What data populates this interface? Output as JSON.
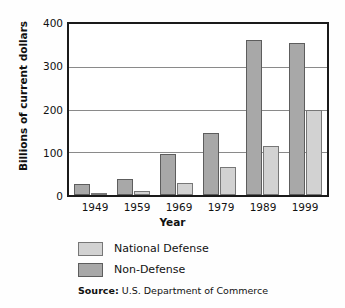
{
  "chart_data": {
    "type": "bar",
    "title": "",
    "xlabel": "Year",
    "ylabel": "Billions of current dollars",
    "categories": [
      "1949",
      "1959",
      "1969",
      "1979",
      "1989",
      "1999"
    ],
    "series": [
      {
        "name": "Non-Defense",
        "values": [
          25,
          38,
          95,
          145,
          362,
          355
        ],
        "color": "#a8a8a8"
      },
      {
        "name": "National Defense",
        "values": [
          5,
          10,
          28,
          65,
          115,
          200
        ],
        "color": "#d2d2d2"
      }
    ],
    "ylim": [
      0,
      400
    ],
    "yticks": [
      "0",
      "100",
      "200",
      "300",
      "400"
    ],
    "ytick_values": [
      0,
      100,
      200,
      300,
      400
    ],
    "grid": true,
    "legend_position": "below-axes"
  },
  "legend": {
    "items": [
      {
        "label": "National Defense",
        "swatch": "light-gray-swatch"
      },
      {
        "label": "Non-Defense",
        "swatch": "dark-gray-swatch"
      }
    ]
  },
  "source": {
    "prefix": "Source:",
    "text": "U.S. Department of Commerce"
  }
}
